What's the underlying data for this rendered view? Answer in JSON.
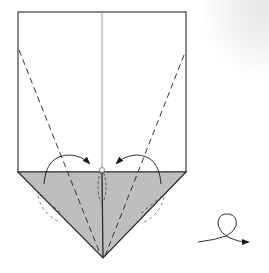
{
  "diagram": {
    "type": "origami-fold-step",
    "paper": {
      "front_color": "#ffffff",
      "back_color": "#bebebe",
      "edge_color": "#3a3a3a",
      "center_crease_color": "#9a9a9a"
    },
    "elements": [
      {
        "id": "paper-rectangle",
        "shape": "rectangle",
        "fill": "white"
      },
      {
        "id": "triangle-flap",
        "shape": "triangle",
        "fill": "grey",
        "position": "bottom"
      },
      {
        "id": "center-crease",
        "shape": "line",
        "style": "solid-thin"
      },
      {
        "id": "valley-fold-left",
        "shape": "line",
        "style": "dashed"
      },
      {
        "id": "valley-fold-right",
        "shape": "line",
        "style": "dashed"
      },
      {
        "id": "fold-arrow-left",
        "shape": "curved-arrow",
        "direction": "to-center"
      },
      {
        "id": "fold-arrow-right",
        "shape": "curved-arrow",
        "direction": "to-center"
      },
      {
        "id": "turn-over-symbol",
        "shape": "looped-arrow",
        "meaning": "turn model over"
      }
    ]
  }
}
